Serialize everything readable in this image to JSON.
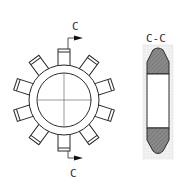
{
  "figure": {
    "main_view": {
      "description": "Ring with 10 radial rectangular teeth, crosshair centerlines",
      "teeth_count": 10,
      "section_label_top": "C",
      "section_label_bottom": "C"
    },
    "section_view": {
      "title": "C-C"
    },
    "colors": {
      "line": "#2a2a2a",
      "hatch_fill": "#8a8a8a",
      "dot_fill": "#e9e9e9",
      "background": "#ffffff"
    }
  }
}
